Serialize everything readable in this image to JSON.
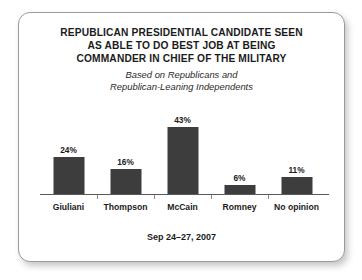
{
  "chart_data": {
    "type": "bar",
    "title": "REPUBLICAN PRESIDENTIAL CANDIDATE SEEN AS ABLE TO DO BEST JOB AT BEING COMMANDER IN CHIEF OF THE MILITARY",
    "title_lines": [
      "REPUBLICAN PRESIDENTIAL CANDIDATE SEEN",
      "AS ABLE TO DO BEST JOB AT BEING",
      "COMMANDER IN CHIEF OF THE MILITARY"
    ],
    "subtitle": "Based on Republicans and Republican-Leaning Independents",
    "subtitle_lines": [
      "Based on Republicans and",
      "Republican-Leaning Independents"
    ],
    "categories": [
      "Giuliani",
      "Thompson",
      "McCain",
      "Romney",
      "No opinion"
    ],
    "values": [
      24,
      16,
      43,
      6,
      11
    ],
    "value_labels": [
      "24%",
      "16%",
      "43%",
      "6%",
      "11%"
    ],
    "xlabel": "",
    "ylabel": "",
    "ylim": [
      0,
      43
    ],
    "grid": false,
    "legend": false,
    "footer": "Sep 24–27, 2007",
    "bar_color": "#3d3d3d",
    "axis_color": "#5a5a5a",
    "background_color": "#ffffff",
    "border_color": "#9a9a9a"
  }
}
